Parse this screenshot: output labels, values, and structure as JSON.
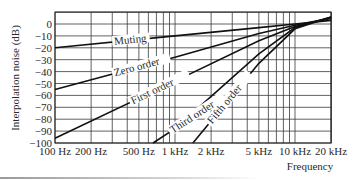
{
  "chart_data": {
    "type": "line",
    "title": "",
    "xlabel": "Frequency",
    "ylabel": "Interpolation noise (dB)",
    "xscale": "log",
    "xlim": [
      100,
      20000
    ],
    "ylim": [
      -100,
      10
    ],
    "grid": true,
    "x_tick_labels": [
      "100 Hz",
      "200 Hz",
      "500 Hz",
      "1 kHz",
      "2 kHz",
      "5 kHz",
      "10 kHz",
      "20 kHz"
    ],
    "x_tick_values": [
      100,
      200,
      500,
      1000,
      2000,
      5000,
      10000,
      20000
    ],
    "y_tick_labels": [
      "0",
      "−10",
      "−20",
      "−30",
      "−40",
      "−50",
      "−60",
      "−70",
      "−80",
      "−90",
      "−100"
    ],
    "y_tick_values": [
      0,
      -10,
      -20,
      -30,
      -40,
      -50,
      -60,
      -70,
      -80,
      -90,
      -100
    ],
    "series": [
      {
        "name": "Muting",
        "points": [
          [
            100,
            -20
          ],
          [
            1000,
            -10
          ],
          [
            5000,
            -3
          ],
          [
            10000,
            0
          ],
          [
            20000,
            3
          ]
        ]
      },
      {
        "name": "Zero order",
        "points": [
          [
            100,
            -55
          ],
          [
            1000,
            -28
          ],
          [
            5000,
            -8
          ],
          [
            10000,
            -1
          ],
          [
            20000,
            5
          ]
        ]
      },
      {
        "name": "First order",
        "points": [
          [
            100,
            -96
          ],
          [
            1000,
            -48
          ],
          [
            5000,
            -14
          ],
          [
            10000,
            -2
          ],
          [
            20000,
            5
          ]
        ]
      },
      {
        "name": "Third order",
        "points": [
          [
            656,
            -100
          ],
          [
            1000,
            -88
          ],
          [
            5000,
            -25
          ],
          [
            10000,
            -3
          ],
          [
            20000,
            6
          ]
        ]
      },
      {
        "name": "Fifth order",
        "points": [
          [
            1410,
            -100
          ],
          [
            5000,
            -33
          ],
          [
            10000,
            -4
          ],
          [
            20000,
            6
          ]
        ]
      }
    ],
    "legend": "inline labels on lines"
  }
}
